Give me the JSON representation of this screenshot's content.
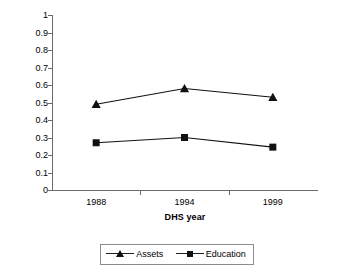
{
  "chart_data": {
    "type": "line",
    "title": "",
    "xlabel": "DHS year",
    "ylabel": "Level of regional HI",
    "categories": [
      "1988",
      "1994",
      "1999"
    ],
    "x": [
      1988,
      1994,
      1999
    ],
    "ylim": [
      0,
      1
    ],
    "ytick_labels": [
      "0",
      "0.1",
      "0.2",
      "0.3",
      "0.4",
      "0.5",
      "0.6",
      "0.7",
      "0.8",
      "0.9",
      "1"
    ],
    "ytick_values": [
      0,
      0.1,
      0.2,
      0.3,
      0.4,
      0.5,
      0.6,
      0.7,
      0.8,
      0.9,
      1
    ],
    "grid": false,
    "legend_position": "bottom",
    "series": [
      {
        "name": "Assets",
        "marker": "triangle",
        "color": "#111111",
        "values": [
          0.49,
          0.58,
          0.53
        ]
      },
      {
        "name": "Education",
        "marker": "square",
        "color": "#111111",
        "values": [
          0.27,
          0.3,
          0.245
        ]
      }
    ]
  },
  "axes": {
    "y_title": "Level of regional HI",
    "x_title": "DHS year",
    "line_color": "#6b6b6b"
  },
  "legend": {
    "entries": [
      {
        "label": "Assets",
        "marker": "triangle-marker"
      },
      {
        "label": "Education",
        "marker": "square-marker"
      }
    ]
  }
}
